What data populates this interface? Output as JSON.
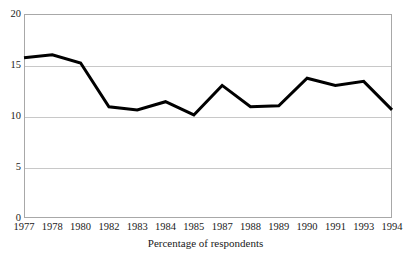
{
  "chart_data": {
    "type": "line",
    "title": "",
    "subtitle": "",
    "xlabel": "Percentage of respondents",
    "ylabel": "",
    "categories": [
      "1977",
      "1978",
      "1980",
      "1982",
      "1983",
      "1984",
      "1985",
      "1987",
      "1988",
      "1989",
      "1990",
      "1991",
      "1993",
      "1994"
    ],
    "values": [
      15.7,
      16.0,
      15.2,
      10.9,
      10.6,
      11.4,
      10.1,
      13.0,
      10.9,
      11.0,
      13.7,
      13.0,
      13.4,
      10.6
    ],
    "series": [
      {
        "name": "Percentage of respondents",
        "values": [
          15.7,
          16.0,
          15.2,
          10.9,
          10.6,
          11.4,
          10.1,
          13.0,
          10.9,
          11.0,
          13.7,
          13.0,
          13.4,
          10.6
        ]
      }
    ],
    "ylim": [
      0,
      20
    ],
    "y_ticks": [
      0,
      5,
      10,
      15,
      20
    ],
    "y_tick_labels": [
      "0",
      "5",
      "10",
      "15",
      "20"
    ],
    "grid": true,
    "grid_axis": "y",
    "legend": false,
    "legend_position": "none",
    "line_color": "#000000",
    "line_width": 3,
    "grid_color": "#c8c8c8",
    "frame_color": "#a8a8a8",
    "background_color": "#ffffff",
    "annotations": []
  },
  "figure": {
    "clipped_text_above": ""
  }
}
